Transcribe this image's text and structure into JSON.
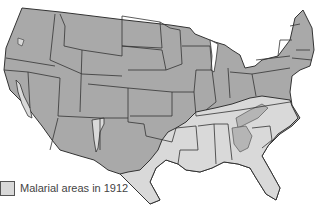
{
  "legend": {
    "label": "Malarial areas in 1912"
  },
  "colors": {
    "non_malarial": "#a9a9a9",
    "malarial": "#d9d9d9",
    "border": "#333333",
    "background": "#ffffff"
  }
}
